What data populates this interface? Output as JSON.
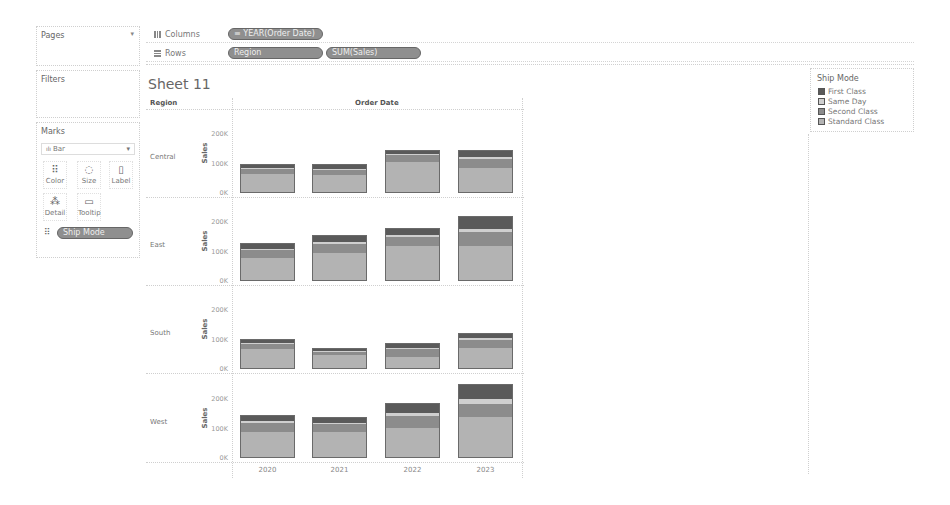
{
  "pages": {
    "title": "Pages",
    "dropdown_icon": "▾"
  },
  "shelves": {
    "columns": {
      "label": "Columns",
      "pills": [
        "≡ YEAR(Order Date)"
      ]
    },
    "rows": {
      "label": "Rows",
      "pills": [
        "Region",
        "SUM(Sales)"
      ]
    }
  },
  "filters": {
    "title": "Filters"
  },
  "marks": {
    "title": "Marks",
    "mark_type": "Bar",
    "buttons": [
      {
        "label": "Color",
        "icon": "color-icon"
      },
      {
        "label": "Size",
        "icon": "size-icon"
      },
      {
        "label": "Label",
        "icon": "label-icon"
      },
      {
        "label": "Detail",
        "icon": "detail-icon"
      },
      {
        "label": "Tooltip",
        "icon": "tooltip-icon"
      }
    ],
    "color_pill": "Ship Mode"
  },
  "sheet": {
    "title": "Sheet 11",
    "row_header": "Region",
    "column_header": "Order Date",
    "axis_title": "Sales",
    "ticks": [
      "200K",
      "100K",
      "0K"
    ]
  },
  "legend": {
    "title": "Ship Mode",
    "items": [
      {
        "label": "First Class",
        "color": "#5a5a5a"
      },
      {
        "label": "Same Day",
        "color": "#cfcfcf"
      },
      {
        "label": "Second Class",
        "color": "#8c8c8c"
      },
      {
        "label": "Standard Class",
        "color": "#b3b3b3"
      }
    ]
  },
  "chart_data": {
    "type": "bar",
    "stacked": true,
    "title": "Sheet 11",
    "xlabel": "Order Date",
    "ylabel": "Sales",
    "facet": "Region",
    "categories": [
      "2020",
      "2021",
      "2022",
      "2023"
    ],
    "ylim": [
      0,
      250000
    ],
    "yticks": [
      "0K",
      "100K",
      "200K"
    ],
    "legend_title": "Ship Mode",
    "legend_position": "right",
    "panels": [
      {
        "region": "Central",
        "series": [
          {
            "name": "Standard Class",
            "values": [
              65,
              62,
              107,
              86
            ]
          },
          {
            "name": "Second Class",
            "values": [
              20,
              18,
              24,
              33
            ]
          },
          {
            "name": "Same Day",
            "values": [
              4,
              4,
              3,
              6
            ]
          },
          {
            "name": "First Class",
            "values": [
              11,
              14,
              13,
              22
            ]
          }
        ],
        "totals": [
          100,
          98,
          147,
          147
        ]
      },
      {
        "region": "East",
        "series": [
          {
            "name": "Standard Class",
            "values": [
              78,
              95,
              120,
              120
            ]
          },
          {
            "name": "Second Class",
            "values": [
              28,
              32,
              30,
              48
            ]
          },
          {
            "name": "Same Day",
            "values": [
              6,
              8,
              8,
              10
            ]
          },
          {
            "name": "First Class",
            "values": [
              18,
              20,
              22,
              42
            ]
          }
        ],
        "totals": [
          130,
          155,
          180,
          220
        ]
      },
      {
        "region": "South",
        "series": [
          {
            "name": "Standard Class",
            "values": [
              70,
              48,
              40,
              72
            ]
          },
          {
            "name": "Second Class",
            "values": [
              18,
              12,
              28,
              28
            ]
          },
          {
            "name": "Same Day",
            "values": [
              4,
              3,
              5,
              7
            ]
          },
          {
            "name": "First Class",
            "values": [
              11,
              8,
              15,
              15
            ]
          }
        ],
        "totals": [
          103,
          71,
          88,
          122
        ]
      },
      {
        "region": "West",
        "series": [
          {
            "name": "Standard Class",
            "values": [
              88,
              88,
              102,
              140
            ]
          },
          {
            "name": "Second Class",
            "values": [
              33,
              28,
              43,
              45
            ]
          },
          {
            "name": "Same Day",
            "values": [
              6,
              5,
              8,
              18
            ]
          },
          {
            "name": "First Class",
            "values": [
              20,
              18,
              35,
              47
            ]
          }
        ],
        "totals": [
          147,
          139,
          188,
          250
        ]
      }
    ],
    "units": "thousands USD"
  }
}
